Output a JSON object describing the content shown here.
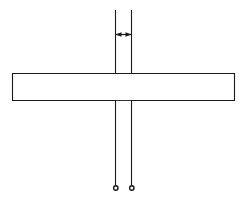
{
  "figure": {
    "type": "technical-line-drawing",
    "background_color": "#ffffff",
    "line_color": "#1a1a1a",
    "fill_color": "#ffffff",
    "canvas": {
      "width": 247,
      "height": 200
    }
  },
  "geometry": {
    "cross": {
      "description": "Outlined plus/cross shape, white filled",
      "vertical_member": {
        "left_x": 115,
        "right_x": 132,
        "width": 17
      },
      "horizontal_member": {
        "left_x": 12,
        "right_x": 234,
        "top_y": 73,
        "bottom_y": 101,
        "height": 28
      },
      "vertical_top_y": 73,
      "vertical_bottom_y": 101
    },
    "extension_lines": [
      {
        "name": "upper-left-extension",
        "x": 115,
        "y_start": 10,
        "y_end": 73
      },
      {
        "name": "upper-right-extension",
        "x": 132,
        "y_start": 10,
        "y_end": 73
      },
      {
        "name": "lower-left-extension",
        "x": 115,
        "y_start": 101,
        "y_end": 186
      },
      {
        "name": "lower-right-extension",
        "x": 132,
        "y_start": 101,
        "y_end": 186
      }
    ],
    "dimension": {
      "name": "vertical-member-width",
      "y": 34,
      "x_start": 115,
      "x_end": 132,
      "arrow_style": "double-headed",
      "label": ""
    },
    "terminators": [
      {
        "name": "left-terminator-dot",
        "cx": 116,
        "cy": 188,
        "r": 2.2
      },
      {
        "name": "right-terminator-dot",
        "cx": 132,
        "cy": 188,
        "r": 2.2
      }
    ]
  }
}
